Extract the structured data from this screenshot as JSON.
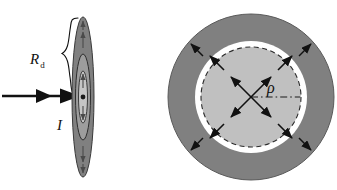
{
  "figure": {
    "background": "#ffffff",
    "width": 337,
    "height": 190
  },
  "colors": {
    "outer_disc_gray": "#808080",
    "inner_disc_gray": "#c0c0c0",
    "ring_white": "#ffffff",
    "stroke_black": "#111111",
    "edge_dark": "#6e6e6e"
  },
  "left_panel": {
    "name": "edge-on-view",
    "description": "Edge-on (side) view of the disc drawn as a narrow vertical ellipse",
    "labels": {
      "radius_symbol": "R",
      "radius_subscript": "d",
      "current_symbol": "I"
    },
    "brace": {
      "name": "radius-brace",
      "spans_from_y": 18,
      "spans_to_y": 96
    },
    "current_arrow": {
      "name": "current-arrow",
      "direction": "right",
      "from_x": 2,
      "to_x": 80,
      "y": 96
    },
    "ellipses": [
      {
        "name": "outer-disc-edge",
        "rx": 11,
        "ry": 80,
        "fill": "#808080"
      },
      {
        "name": "mid-disc-edge",
        "rx": 7,
        "ry": 42,
        "fill": "#9a9a9a"
      },
      {
        "name": "inner-disc-edge",
        "rx": 4,
        "ry": 26,
        "fill": "#c4c4c4"
      }
    ],
    "internal_arrow_count": 6
  },
  "right_panel": {
    "name": "face-on-view",
    "description": "Face-on (top) view: dark grey outer annulus, white gap ring, light grey inner disc with dashed edge, radial arrows pointing outward",
    "labels": {
      "rho_symbol": "ρ"
    },
    "circles": [
      {
        "name": "outer-disc",
        "radius": 83,
        "fill": "#808080"
      },
      {
        "name": "white-gap-ring",
        "radius": 56,
        "fill": "#ffffff"
      },
      {
        "name": "inner-disc",
        "radius": 50,
        "fill": "#c0c0c0",
        "border": "dashed"
      }
    ],
    "rho_line": {
      "name": "rho-dash-dot-line",
      "style": "dash-dot",
      "from": "center",
      "to": "inner-disc-edge",
      "direction": "right"
    },
    "center_arrows": {
      "name": "center-radial-arrows",
      "count": 4,
      "angles_deg": [
        45,
        135,
        225,
        315
      ],
      "length": 28
    },
    "ring_arrows": {
      "name": "inner-ring-outward-arrows",
      "count": 4,
      "angles_deg": [
        45,
        135,
        225,
        315
      ]
    },
    "outer_arrows": {
      "name": "outer-annulus-arrows",
      "count": 4,
      "angles_deg": [
        50,
        130,
        230,
        310
      ]
    }
  }
}
